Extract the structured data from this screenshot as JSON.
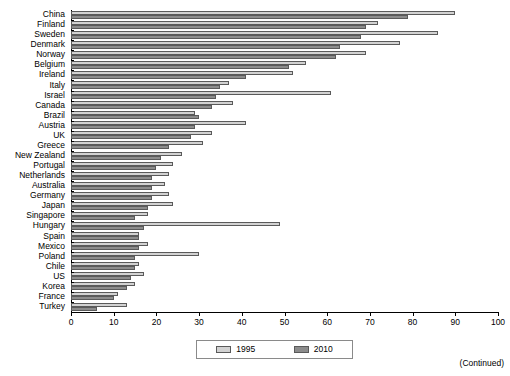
{
  "chart_data": {
    "type": "bar",
    "orientation": "horizontal",
    "title": "",
    "xlabel": "",
    "ylabel": "",
    "xlim": [
      0,
      100
    ],
    "xticks": [
      0,
      10,
      20,
      30,
      40,
      50,
      60,
      70,
      80,
      90,
      100
    ],
    "grid": false,
    "legend_position": "bottom-center",
    "categories": [
      "China",
      "Finland",
      "Sweden",
      "Denmark",
      "Norway",
      "Belgium",
      "Ireland",
      "Italy",
      "Israel",
      "Canada",
      "Brazil",
      "Austria",
      "UK",
      "Greece",
      "New Zealand",
      "Portugal",
      "Netherlands",
      "Australia",
      "Germany",
      "Japan",
      "Singapore",
      "Hungary",
      "Spain",
      "Mexico",
      "Poland",
      "Chile",
      "US",
      "Korea",
      "France",
      "Turkey"
    ],
    "series": [
      {
        "name": "1995",
        "color": "#d2d2d2",
        "values": [
          90,
          72,
          86,
          77,
          69,
          55,
          52,
          37,
          61,
          38,
          29,
          41,
          33,
          31,
          26,
          24,
          23,
          22,
          23,
          24,
          18,
          49,
          16,
          18,
          30,
          16,
          17,
          15,
          11,
          13
        ]
      },
      {
        "name": "2010",
        "color": "#8c8c8c",
        "values": [
          79,
          69,
          68,
          63,
          62,
          51,
          41,
          35,
          34,
          33,
          30,
          29,
          28,
          23,
          21,
          20,
          19,
          19,
          19,
          18,
          15,
          17,
          16,
          16,
          15,
          15,
          14,
          13,
          10,
          6
        ]
      }
    ],
    "legend_entries": [
      "1995",
      "2010"
    ]
  },
  "footer": {
    "continued_note": "(Continued)"
  }
}
